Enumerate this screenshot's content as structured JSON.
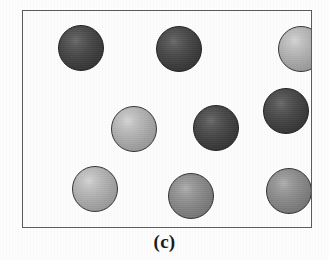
{
  "figure": {
    "caption": "(c)",
    "panel_label": "(c)",
    "frame": {
      "border_color": "#5c5c5c",
      "background_color": "#fdfdfd"
    },
    "background_color": "#fefefe"
  },
  "legend": {
    "dark_color": "#3d3d3d",
    "medium_color": "#8d8d8d",
    "light_color": "#b4b4b4"
  },
  "chart_data": {
    "type": "scatter",
    "title": "(c)",
    "xlabel": "",
    "ylabel": "",
    "xlim": [
      0,
      290
    ],
    "ylim": [
      0,
      218
    ],
    "grid": false,
    "legend_position": "none",
    "note": "Schematic of nine shaded spheres (particles) distributed inside a rectangular container; shading classes represent two/three particle types.",
    "counts": {
      "dark": 4,
      "medium": 2,
      "light": 3,
      "total": 9
    },
    "series": [
      {
        "name": "particles",
        "points": [
          {
            "id": "particle-1",
            "label": "top-left",
            "x": 35,
            "y": 14,
            "r": 23,
            "shade": "dark"
          },
          {
            "id": "particle-2",
            "label": "top-center",
            "x": 133,
            "y": 15,
            "r": 23,
            "shade": "dark"
          },
          {
            "id": "particle-3",
            "label": "top-right",
            "x": 255,
            "y": 15,
            "r": 23,
            "shade": "light"
          },
          {
            "id": "particle-4",
            "label": "middle-left",
            "x": 88,
            "y": 95,
            "r": 23,
            "shade": "light"
          },
          {
            "id": "particle-5",
            "label": "middle-center",
            "x": 170,
            "y": 94,
            "r": 23,
            "shade": "dark"
          },
          {
            "id": "particle-6",
            "label": "middle-right",
            "x": 240,
            "y": 77,
            "r": 23,
            "shade": "dark"
          },
          {
            "id": "particle-7",
            "label": "bottom-left",
            "x": 49,
            "y": 155,
            "r": 23,
            "shade": "light"
          },
          {
            "id": "particle-8",
            "label": "bottom-center",
            "x": 145,
            "y": 162,
            "r": 23,
            "shade": "medium"
          },
          {
            "id": "particle-9",
            "label": "bottom-right",
            "x": 243,
            "y": 157,
            "r": 23,
            "shade": "medium"
          }
        ]
      }
    ]
  }
}
